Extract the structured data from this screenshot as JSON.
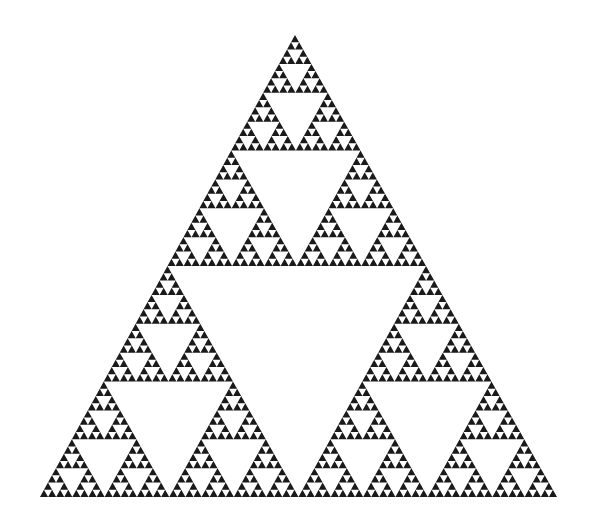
{
  "figure": {
    "title": "Sierpinski triangle",
    "type": "fractal",
    "depth": 6,
    "background_color": "#ffffff",
    "fill_color": "#1a1a1a",
    "vertices": {
      "apex": [
        295,
        35
      ],
      "bottom_left": [
        40,
        497
      ],
      "bottom_right": [
        557,
        497
      ]
    }
  }
}
